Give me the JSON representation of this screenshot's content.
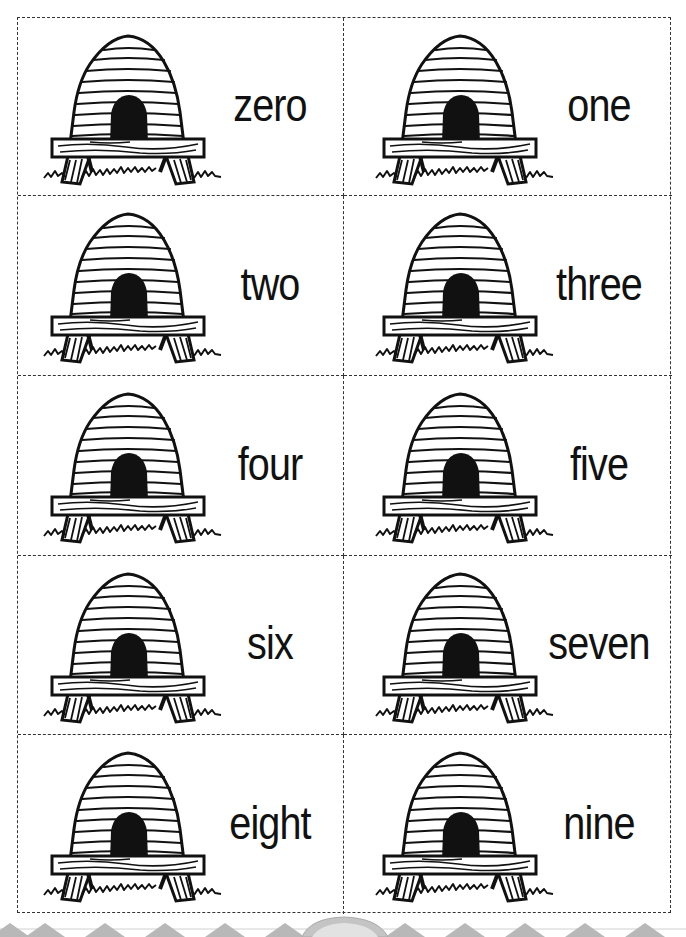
{
  "worksheet": {
    "cards": [
      {
        "word": "zero",
        "picture": "beehive"
      },
      {
        "word": "one",
        "picture": "beehive"
      },
      {
        "word": "two",
        "picture": "beehive"
      },
      {
        "word": "three",
        "picture": "beehive"
      },
      {
        "word": "four",
        "picture": "beehive"
      },
      {
        "word": "five",
        "picture": "beehive"
      },
      {
        "word": "six",
        "picture": "beehive"
      },
      {
        "word": "seven",
        "picture": "beehive"
      },
      {
        "word": "eight",
        "picture": "beehive"
      },
      {
        "word": "nine",
        "picture": "beehive"
      }
    ],
    "layout": {
      "columns": 2,
      "rows": 5,
      "cut_line": "dashed"
    },
    "colors": {
      "ink": "#111111",
      "cut_line": "#333333",
      "footer_decoration": "#b5b5b5"
    }
  }
}
